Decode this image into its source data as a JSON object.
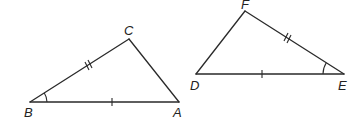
{
  "figure": {
    "width": 364,
    "height": 124,
    "stroke_color": "#2a2a2a",
    "label_color": "#222222"
  },
  "triangles": [
    {
      "name": "ABC",
      "vertices": {
        "B": {
          "x": 30,
          "y": 102,
          "label": "B",
          "label_x": 24,
          "label_y": 106
        },
        "A": {
          "x": 179,
          "y": 102,
          "label": "A",
          "label_x": 173,
          "label_y": 106
        },
        "C": {
          "x": 129,
          "y": 39,
          "label": "C",
          "label_x": 124,
          "label_y": 24
        }
      },
      "markings": {
        "BA": "single-tick",
        "BC": "double-tick",
        "angle_B": "single-arc"
      }
    },
    {
      "name": "DEF",
      "vertices": {
        "D": {
          "x": 196,
          "y": 74,
          "label": "D",
          "label_x": 190,
          "label_y": 79
        },
        "E": {
          "x": 344,
          "y": 74,
          "label": "E",
          "label_x": 338,
          "label_y": 79
        },
        "F": {
          "x": 245,
          "y": 11,
          "label": "F",
          "label_x": 241,
          "label_y": -2
        }
      },
      "markings": {
        "DE": "single-tick",
        "FE": "double-tick",
        "angle_E": "single-arc"
      }
    }
  ]
}
